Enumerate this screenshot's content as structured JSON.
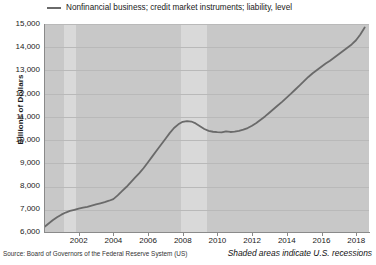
{
  "chart_data": {
    "type": "line",
    "title": "",
    "xlabel": "",
    "ylabel": "Billions of Dollars",
    "legend": [
      "Nonfinancial business; credit market instruments; liability, level"
    ],
    "legend_position": "top-left",
    "grid": true,
    "xlim": [
      2000.0,
      2018.75
    ],
    "ylim": [
      6000,
      15000
    ],
    "ytick_labels": [
      "15,000",
      "14,000",
      "13,000",
      "12,000",
      "11,000",
      "10,000",
      "9,000",
      "8,000",
      "7,000",
      "6,000"
    ],
    "ytick_values": [
      15000,
      14000,
      13000,
      12000,
      11000,
      10000,
      9000,
      8000,
      7000,
      6000
    ],
    "xtick_labels": [
      "2002",
      "2004",
      "2006",
      "2008",
      "2010",
      "2012",
      "2014",
      "2016",
      "2018"
    ],
    "xtick_values": [
      2002,
      2004,
      2006,
      2008,
      2010,
      2012,
      2014,
      2016,
      2018
    ],
    "series": [
      {
        "name": "Nonfinancial business; credit market instruments; liability, level",
        "color": "#6a6a6a",
        "x": [
          2000.0,
          2000.25,
          2000.5,
          2000.75,
          2001.0,
          2001.25,
          2001.5,
          2001.75,
          2002.0,
          2002.25,
          2002.5,
          2002.75,
          2003.0,
          2003.25,
          2003.5,
          2003.75,
          2004.0,
          2004.25,
          2004.5,
          2004.75,
          2005.0,
          2005.25,
          2005.5,
          2005.75,
          2006.0,
          2006.25,
          2006.5,
          2006.75,
          2007.0,
          2007.25,
          2007.5,
          2007.75,
          2008.0,
          2008.25,
          2008.5,
          2008.75,
          2009.0,
          2009.25,
          2009.5,
          2009.75,
          2010.0,
          2010.25,
          2010.5,
          2010.75,
          2011.0,
          2011.25,
          2011.5,
          2011.75,
          2012.0,
          2012.25,
          2012.5,
          2012.75,
          2013.0,
          2013.25,
          2013.5,
          2013.75,
          2014.0,
          2014.25,
          2014.5,
          2014.75,
          2015.0,
          2015.25,
          2015.5,
          2015.75,
          2016.0,
          2016.25,
          2016.5,
          2016.75,
          2017.0,
          2017.25,
          2017.5,
          2017.75,
          2018.0,
          2018.25,
          2018.5
        ],
        "y": [
          6250,
          6400,
          6550,
          6680,
          6790,
          6880,
          6950,
          7000,
          7050,
          7090,
          7130,
          7180,
          7230,
          7280,
          7330,
          7390,
          7460,
          7620,
          7800,
          7980,
          8180,
          8380,
          8580,
          8800,
          9050,
          9300,
          9550,
          9800,
          10050,
          10300,
          10520,
          10680,
          10790,
          10820,
          10800,
          10720,
          10600,
          10480,
          10400,
          10360,
          10340,
          10330,
          10380,
          10350,
          10370,
          10400,
          10450,
          10520,
          10620,
          10740,
          10880,
          11020,
          11180,
          11340,
          11500,
          11660,
          11830,
          12000,
          12180,
          12360,
          12540,
          12720,
          12880,
          13020,
          13160,
          13300,
          13420,
          13560,
          13700,
          13840,
          13980,
          14120,
          14300,
          14550,
          14850
        ]
      }
    ],
    "shaded_regions": [
      {
        "label": "U.S. recession",
        "start": 2001.17,
        "end": 2001.83
      },
      {
        "label": "U.S. recession",
        "start": 2007.92,
        "end": 2009.42
      }
    ],
    "shaded_note": "Shaded areas indicate U.S. recessions",
    "source": "Source: Board of Governors of the Federal Reserve System (US)",
    "colors": {
      "line": "#6a6a6a",
      "plot_background": "#c8c8c8",
      "recession_band": "#d9d9d9",
      "gridline": "#b9b9b9"
    }
  }
}
